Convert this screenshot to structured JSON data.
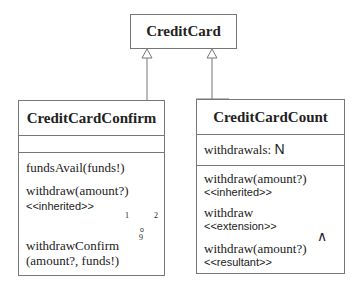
{
  "parent": {
    "name": "CreditCard"
  },
  "left": {
    "name": "CreditCardConfirm",
    "attributes": "",
    "ops": {
      "funds": "fundsAvail(funds!)",
      "withdraw": "withdraw(amount?)",
      "withdraw_stereo": "<<inherited>>",
      "confirm1": "withdrawConfirm",
      "confirm2": "(amount?, funds!)"
    },
    "gate": {
      "symbol_top": "o",
      "symbol_bottom": "9",
      "port1": "1",
      "port2": "2"
    }
  },
  "right": {
    "name": "CreditCardCount",
    "attribute_name": "withdrawals:",
    "attribute_type": "N",
    "ops": {
      "w1": "withdraw(amount?)",
      "w1_stereo": "<<inherited>>",
      "w2": "withdraw",
      "w2_stereo": "<<extension>>",
      "w3": "withdraw(amount?)",
      "w3_stereo": "<<resultant>>"
    },
    "gate": {
      "symbol": "∧"
    }
  }
}
